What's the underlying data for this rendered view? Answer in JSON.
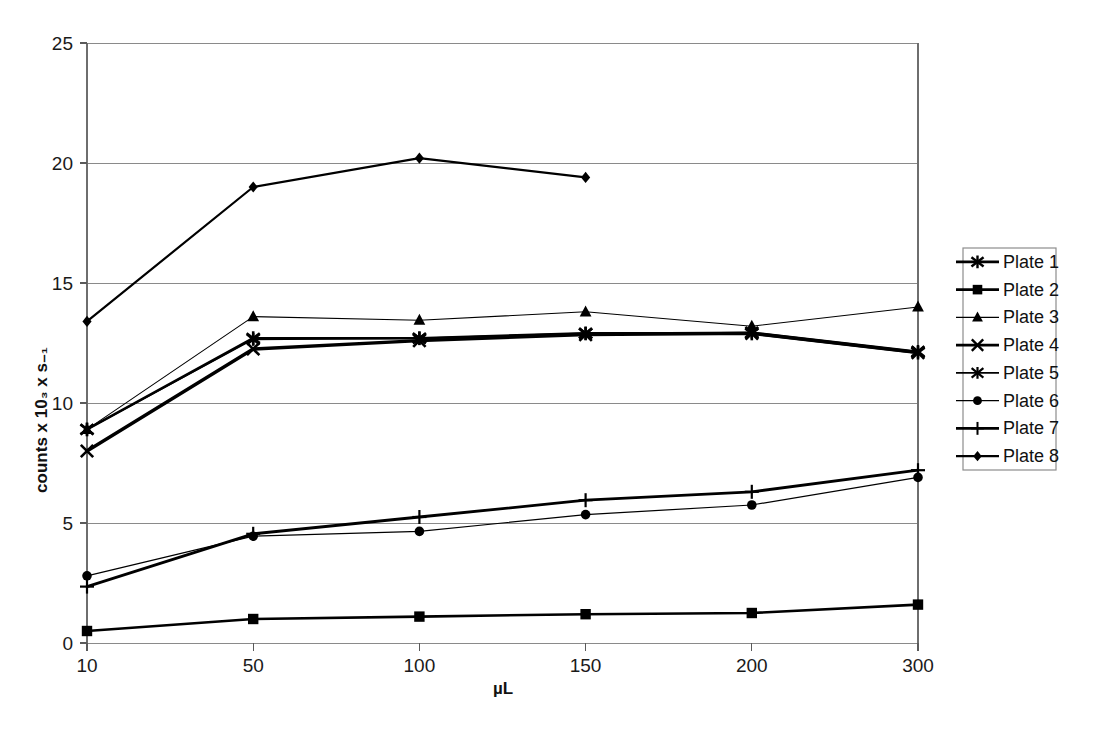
{
  "chart_data": {
    "type": "line",
    "title": "",
    "xlabel": "µL",
    "ylabel": "counts x 10₃ x s₋₁",
    "categories": [
      "10",
      "50",
      "100",
      "150",
      "200",
      "300"
    ],
    "x_tick_labels": [
      "10",
      "50",
      "100",
      "150",
      "200",
      "300"
    ],
    "y_tick_labels": [
      "0",
      "5",
      "10",
      "15",
      "20",
      "25"
    ],
    "ylim": [
      0,
      25
    ],
    "y_major_step": 5,
    "grid": "horizontal",
    "legend_position": "right",
    "series": [
      {
        "name": "Plate 1",
        "marker": "asterisk-x",
        "line_width": 2.6,
        "values": [
          8.9,
          12.7,
          12.7,
          12.9,
          12.9,
          12.1
        ]
      },
      {
        "name": "Plate 2",
        "marker": "square",
        "line_width": 2.6,
        "values": [
          0.5,
          1.0,
          1.1,
          1.2,
          1.25,
          1.6
        ]
      },
      {
        "name": "Plate 3",
        "marker": "triangle",
        "line_width": 1.1,
        "values": [
          8.9,
          13.6,
          13.45,
          13.8,
          13.2,
          14.0
        ]
      },
      {
        "name": "Plate 4",
        "marker": "x",
        "line_width": 3.4,
        "values": [
          8.0,
          12.25,
          12.6,
          12.85,
          12.9,
          12.1
        ]
      },
      {
        "name": "Plate 5",
        "marker": "asterisk",
        "line_width": 1.6,
        "values": [
          8.9,
          12.65,
          12.7,
          12.9,
          12.95,
          12.15
        ]
      },
      {
        "name": "Plate 6",
        "marker": "circle",
        "line_width": 1.2,
        "values": [
          2.8,
          4.45,
          4.65,
          5.35,
          5.75,
          6.9
        ]
      },
      {
        "name": "Plate 7",
        "marker": "plus",
        "line_width": 2.8,
        "values": [
          2.35,
          4.55,
          5.25,
          5.95,
          6.3,
          7.2
        ]
      },
      {
        "name": "Plate 8",
        "marker": "diamond",
        "line_width": 2.2,
        "values": [
          13.4,
          19.0,
          20.2,
          19.4,
          null,
          null
        ]
      }
    ]
  },
  "legend": {
    "entries": [
      {
        "label": "Plate 1"
      },
      {
        "label": "Plate 2"
      },
      {
        "label": "Plate 3"
      },
      {
        "label": "Plate 4"
      },
      {
        "label": "Plate 5"
      },
      {
        "label": "Plate 6"
      },
      {
        "label": "Plate 7"
      },
      {
        "label": "Plate 8"
      }
    ]
  },
  "colors": {
    "series": "#000000",
    "grid": "#8a8a8a",
    "axis": "#6e6e6e",
    "background": "#ffffff"
  }
}
